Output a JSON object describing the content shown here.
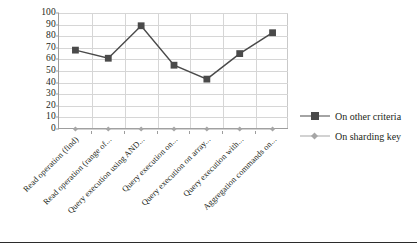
{
  "chart_data": {
    "type": "line",
    "title": "",
    "xlabel": "",
    "ylabel": "",
    "ylim": [
      0,
      100
    ],
    "ytick_values": [
      100,
      90,
      80,
      70,
      60,
      50,
      40,
      30,
      20,
      10,
      0
    ],
    "ytick_labels": [
      "100",
      "90",
      "80",
      "70",
      "60",
      "50",
      "40",
      "30",
      "20",
      "10",
      "0"
    ],
    "grid": true,
    "legend_position": "right",
    "categories": [
      "Read operation (find)",
      "Read operation (range of...",
      "Query execution using AND...",
      "Query execution on...",
      "Query execution on array...",
      "Query execution with...",
      "Aggregation commands on..."
    ],
    "series": [
      {
        "name": "On other criteria",
        "color": "#4a4a4a",
        "marker": "square",
        "values": [
          68,
          61,
          89,
          55,
          43,
          65,
          83
        ]
      },
      {
        "name": "On sharding key",
        "color": "#a6a6a6",
        "marker": "diamond",
        "values": [
          0,
          0,
          0,
          0,
          0,
          0,
          0
        ]
      }
    ]
  },
  "legend": {
    "items": [
      {
        "label": "On other criteria"
      },
      {
        "label": "On sharding key"
      }
    ]
  }
}
